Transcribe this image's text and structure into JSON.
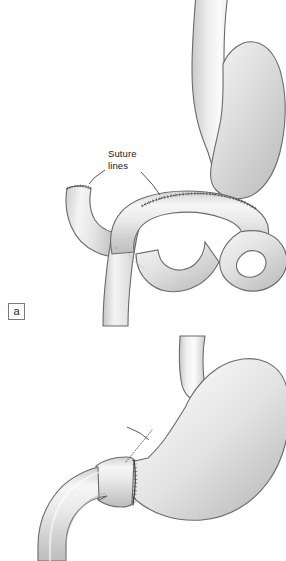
{
  "figure": {
    "background_color": "#ffffff",
    "width": 286,
    "height": 561,
    "line_color": "#5a5a5a",
    "fill_light": "#f7f7f7",
    "fill_mid": "#dcdcdc",
    "fill_dark": "#bdbdbd",
    "suture_color": "#4a4a52",
    "text_color": "#17171a"
  },
  "panels": [
    {
      "id": "a",
      "tag": "a",
      "annotation": {
        "name": "suture-lines-label",
        "text": "Suture\nlines",
        "line1": "Suture",
        "line2": "lines",
        "leader_count": 2
      },
      "anatomy": [
        "esophagus",
        "gastric-remnant",
        "duodenal-stump",
        "jejunal-limb",
        "jejunal-loop",
        "gastrojejunal-anastomosis"
      ]
    },
    {
      "id": "b",
      "tag": "b",
      "annotation": {
        "name": "suture-line-label",
        "text": "Suture line",
        "line1": "Suture line",
        "leader_count": 1
      },
      "anatomy": [
        "esophagus",
        "stomach-body",
        "duodenal-cuff",
        "duodenum",
        "gastroduodenal-anastomosis"
      ]
    }
  ]
}
